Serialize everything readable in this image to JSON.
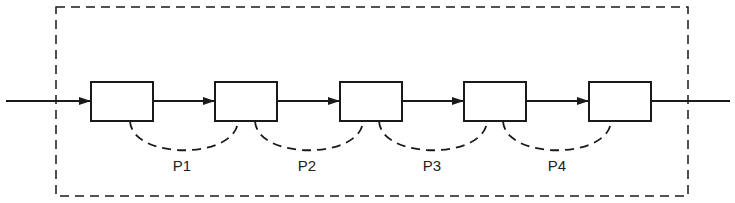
{
  "diagram": {
    "type": "pipeline",
    "boundary": {
      "style": "dashed",
      "x": 56,
      "y": 7,
      "width": 632,
      "height": 189
    },
    "stages": [
      {
        "id": "stage-1",
        "x": 91
      },
      {
        "id": "stage-2",
        "x": 215
      },
      {
        "id": "stage-3",
        "x": 340
      },
      {
        "id": "stage-4",
        "x": 464
      },
      {
        "id": "stage-5",
        "x": 589
      }
    ],
    "links": [
      {
        "label": "P1",
        "from": "stage-1",
        "to": "stage-2"
      },
      {
        "label": "P2",
        "from": "stage-2",
        "to": "stage-3"
      },
      {
        "label": "P3",
        "from": "stage-3",
        "to": "stage-4"
      },
      {
        "label": "P4",
        "from": "stage-4",
        "to": "stage-5"
      }
    ],
    "colors": {
      "stroke": "#1a1a1a",
      "background": "#ffffff"
    }
  }
}
